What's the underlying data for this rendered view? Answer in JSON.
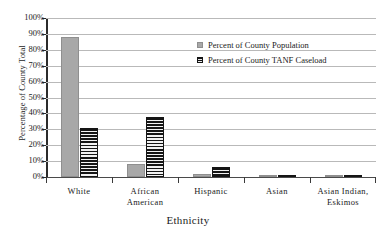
{
  "top_clipped_text": "",
  "chart_data": {
    "type": "bar",
    "title": "",
    "xlabel": "Ethnicity",
    "ylabel": "Percentage of County Total",
    "categories": [
      "White",
      "African American",
      "Hispanic",
      "Asian",
      "Asian Indian, Eskimos"
    ],
    "category_lines": [
      [
        "White"
      ],
      [
        "African",
        "American"
      ],
      [
        "Hispanic"
      ],
      [
        "Asian"
      ],
      [
        "Asian Indian,",
        "Eskimos"
      ]
    ],
    "series": [
      {
        "name": "Percent of County Population",
        "color": "#a8a8a8",
        "pattern": "solid",
        "values": [
          88,
          8,
          2,
          0.8,
          0
        ]
      },
      {
        "name": "Percent of County TANF Caseload",
        "color": "#151515",
        "pattern": "horizontal-hatch",
        "values": [
          31,
          38,
          6,
          1.2,
          1
        ]
      }
    ],
    "ylim": [
      0,
      100
    ],
    "ytick_values": [
      0,
      10,
      20,
      30,
      40,
      50,
      60,
      70,
      80,
      90,
      100
    ],
    "ytick_labels": [
      "0%",
      "10%",
      "20%",
      "30%",
      "40%",
      "50%",
      "60%",
      "70%",
      "80%",
      "90%",
      "100%"
    ],
    "grid": true,
    "grid_axis": "y",
    "legend_position": "inside-top-right"
  },
  "legend": {
    "entries": [
      {
        "label": "Percent of County Population",
        "swatch": "gray-square"
      },
      {
        "label": "Percent of County TANF Caseload",
        "swatch": "hatched-square"
      }
    ]
  },
  "axes": {
    "y_title": "Percentage of County Total",
    "x_title": "Ethnicity"
  }
}
